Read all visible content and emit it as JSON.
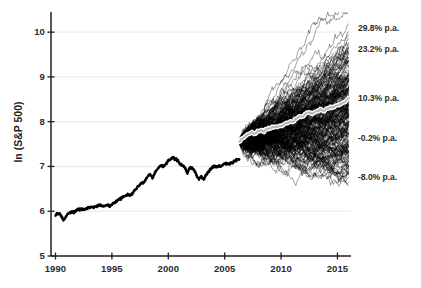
{
  "chart_data": {
    "type": "line",
    "title": "",
    "subtitle": "",
    "xlabel": "",
    "ylabel": "ln (S&P 500)",
    "xlim": [
      1989.6,
      2016.2
    ],
    "ylim": [
      5,
      10.45
    ],
    "xticks": [
      "1990",
      "1995",
      "2000",
      "2005",
      "2010",
      "2015"
    ],
    "xtick_values": [
      1990,
      1995,
      2000,
      2005,
      2010,
      2015
    ],
    "yticks": [
      "5",
      "6",
      "7",
      "8",
      "9",
      "10"
    ],
    "ytick_values": [
      5,
      6,
      7,
      8,
      9,
      10
    ],
    "grid": "horizontal",
    "legend": "none",
    "annotations": [
      {
        "label": "29.8% p.a.",
        "y": 10.1,
        "series": "best-case-path"
      },
      {
        "label": "23.2% p.a.",
        "y": 9.62,
        "series": "high-path"
      },
      {
        "label": "10.3% p.a.",
        "y": 8.53,
        "series": "median-path"
      },
      {
        "label": "-0.2% p.a.",
        "y": 7.64,
        "series": "flat-path"
      },
      {
        "label": "-8.0% p.a.",
        "y": 6.76,
        "series": "worst-case-path"
      }
    ],
    "series": [
      {
        "name": "Historical ln(S&P 500)",
        "style": "thick-black-line",
        "x_start": 1990,
        "x_end": 2006.3,
        "y_start": 5.91,
        "y_end": 7.55,
        "values": [
          [
            1990.0,
            5.91
          ],
          [
            1990.1,
            5.95
          ],
          [
            1990.2,
            5.93
          ],
          [
            1990.3,
            5.96
          ],
          [
            1990.42,
            5.93
          ],
          [
            1990.55,
            5.88
          ],
          [
            1990.7,
            5.8
          ],
          [
            1990.8,
            5.83
          ],
          [
            1990.92,
            5.87
          ],
          [
            1991.05,
            5.93
          ],
          [
            1991.2,
            5.96
          ],
          [
            1991.35,
            5.97
          ],
          [
            1991.5,
            5.99
          ],
          [
            1991.65,
            5.98
          ],
          [
            1991.8,
            6.0
          ],
          [
            1991.95,
            6.05
          ],
          [
            1992.1,
            6.05
          ],
          [
            1992.25,
            6.04
          ],
          [
            1992.4,
            6.05
          ],
          [
            1992.55,
            6.04
          ],
          [
            1992.7,
            6.06
          ],
          [
            1992.85,
            6.07
          ],
          [
            1993.0,
            6.08
          ],
          [
            1993.2,
            6.09
          ],
          [
            1993.4,
            6.1
          ],
          [
            1993.6,
            6.11
          ],
          [
            1993.8,
            6.13
          ],
          [
            1994.0,
            6.14
          ],
          [
            1994.2,
            6.11
          ],
          [
            1994.4,
            6.12
          ],
          [
            1994.6,
            6.13
          ],
          [
            1994.8,
            6.12
          ],
          [
            1995.0,
            6.14
          ],
          [
            1995.2,
            6.19
          ],
          [
            1995.4,
            6.23
          ],
          [
            1995.6,
            6.26
          ],
          [
            1995.8,
            6.29
          ],
          [
            1996.0,
            6.32
          ],
          [
            1996.2,
            6.35
          ],
          [
            1996.4,
            6.37
          ],
          [
            1996.6,
            6.36
          ],
          [
            1996.8,
            6.4
          ],
          [
            1997.0,
            6.46
          ],
          [
            1997.2,
            6.52
          ],
          [
            1997.4,
            6.57
          ],
          [
            1997.6,
            6.64
          ],
          [
            1997.8,
            6.63
          ],
          [
            1998.0,
            6.7
          ],
          [
            1998.2,
            6.78
          ],
          [
            1998.4,
            6.83
          ],
          [
            1998.6,
            6.74
          ],
          [
            1998.8,
            6.85
          ],
          [
            1999.0,
            6.93
          ],
          [
            1999.2,
            6.99
          ],
          [
            1999.4,
            7.02
          ],
          [
            1999.6,
            7.0
          ],
          [
            1999.8,
            7.05
          ],
          [
            2000.0,
            7.13
          ],
          [
            2000.15,
            7.16
          ],
          [
            2000.3,
            7.19
          ],
          [
            2000.45,
            7.2
          ],
          [
            2000.6,
            7.17
          ],
          [
            2000.75,
            7.15
          ],
          [
            2000.9,
            7.11
          ],
          [
            2001.05,
            7.05
          ],
          [
            2001.2,
            7.03
          ],
          [
            2001.4,
            7.0
          ],
          [
            2001.55,
            6.93
          ],
          [
            2001.7,
            6.85
          ],
          [
            2001.85,
            6.96
          ],
          [
            2002.0,
            6.98
          ],
          [
            2002.15,
            6.95
          ],
          [
            2002.3,
            6.9
          ],
          [
            2002.45,
            6.84
          ],
          [
            2002.6,
            6.76
          ],
          [
            2002.75,
            6.72
          ],
          [
            2002.9,
            6.78
          ],
          [
            2003.0,
            6.74
          ],
          [
            2003.15,
            6.71
          ],
          [
            2003.3,
            6.79
          ],
          [
            2003.5,
            6.87
          ],
          [
            2003.7,
            6.92
          ],
          [
            2003.9,
            6.98
          ],
          [
            2004.1,
            7.0
          ],
          [
            2004.3,
            6.99
          ],
          [
            2004.5,
            7.01
          ],
          [
            2004.7,
            7.0
          ],
          [
            2004.9,
            7.06
          ],
          [
            2005.1,
            7.07
          ],
          [
            2005.3,
            7.05
          ],
          [
            2005.5,
            7.08
          ],
          [
            2005.7,
            7.09
          ],
          [
            2005.9,
            7.12
          ],
          [
            2006.1,
            7.15
          ],
          [
            2006.3,
            7.16
          ]
        ]
      },
      {
        "name": "Simulated future paths (Monte Carlo)",
        "style": "thin-black-lines-fan",
        "count": 220,
        "x_start": 2006.3,
        "x_end": 2016.0,
        "y_start": 7.55,
        "fan_top_end": 10.12,
        "fan_bottom_end": 6.72
      },
      {
        "name": "Median simulated path",
        "style": "thick-white-highlight-line",
        "x_start": 2006.3,
        "x_end": 2016.0,
        "y_start": 7.55,
        "y_end": 8.53
      }
    ]
  },
  "axes": {
    "y_axis_label": "ln (S&P 500)"
  }
}
